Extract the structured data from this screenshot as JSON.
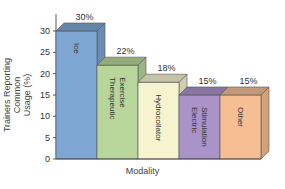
{
  "chart_data": {
    "type": "bar",
    "title": "",
    "xlabel": "Modality",
    "ylabel": "Trainers Reporting Common Usage (%)",
    "ylim": [
      0,
      30
    ],
    "yticks": [
      0,
      5,
      10,
      15,
      20,
      25,
      30
    ],
    "categories": [
      "Ice",
      "Therapeutic Exercise",
      "Hydrocollator",
      "Electric Stimulation",
      "Other"
    ],
    "values": [
      30,
      22,
      18,
      15,
      15
    ],
    "data_labels": [
      "30%",
      "22%",
      "18%",
      "15%",
      "15%"
    ],
    "colors": [
      "#7ea6d3",
      "#b8d69a",
      "#f6f4cf",
      "#a993c9",
      "#f5be93"
    ],
    "grid": false,
    "legend": null,
    "style": "3d-bar"
  },
  "ylabel_lines": [
    "Trainers Reporting Common",
    "Usage (%)"
  ]
}
